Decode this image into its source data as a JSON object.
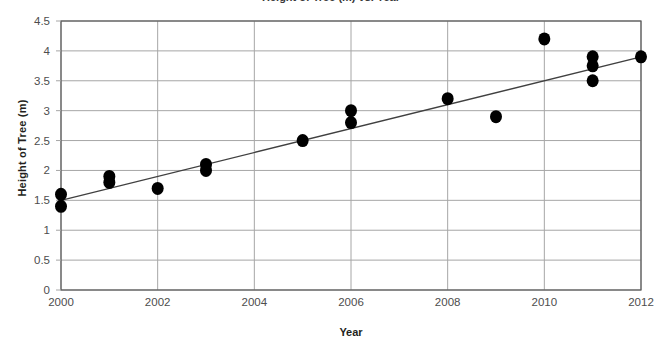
{
  "chart_data": {
    "type": "scatter",
    "title": "Height of Tree (m) vs. Year",
    "xlabel": "Year",
    "ylabel": "Height of Tree (m)",
    "xlim": [
      2000,
      2012
    ],
    "ylim": [
      0,
      4.5
    ],
    "x_ticks": [
      2000,
      2002,
      2004,
      2006,
      2008,
      2010,
      2012
    ],
    "x_tick_labels": [
      "2000",
      "2002",
      "2004",
      "2006",
      "2008",
      "2010",
      "2012"
    ],
    "y_ticks": [
      0,
      0.5,
      1,
      1.5,
      2,
      2.5,
      3,
      3.5,
      4,
      4.5
    ],
    "y_tick_labels": [
      "0",
      "0.5",
      "1",
      "1.5",
      "2",
      "2.5",
      "3",
      "3.5",
      "4",
      "4.5"
    ],
    "grid": "both",
    "legend": "none",
    "marker_color": "#000000",
    "marker_shape": "circle",
    "gridline_color": "#a6a6a6",
    "trendline_color": "#404040",
    "points": [
      {
        "x": 2000,
        "y": 1.4
      },
      {
        "x": 2000,
        "y": 1.6
      },
      {
        "x": 2001,
        "y": 1.8
      },
      {
        "x": 2001,
        "y": 1.9
      },
      {
        "x": 2002,
        "y": 1.7
      },
      {
        "x": 2003,
        "y": 2.0
      },
      {
        "x": 2003,
        "y": 2.1
      },
      {
        "x": 2005,
        "y": 2.5
      },
      {
        "x": 2006,
        "y": 2.8
      },
      {
        "x": 2006,
        "y": 3.0
      },
      {
        "x": 2008,
        "y": 3.2
      },
      {
        "x": 2009,
        "y": 2.9
      },
      {
        "x": 2010,
        "y": 4.2
      },
      {
        "x": 2011,
        "y": 3.5
      },
      {
        "x": 2011,
        "y": 3.75
      },
      {
        "x": 2011,
        "y": 3.9
      },
      {
        "x": 2012,
        "y": 3.9
      }
    ],
    "trendline": {
      "label": "line of best fit",
      "x_start": 2000,
      "y_start": 1.5,
      "x_end": 2012,
      "y_end": 3.9
    }
  }
}
